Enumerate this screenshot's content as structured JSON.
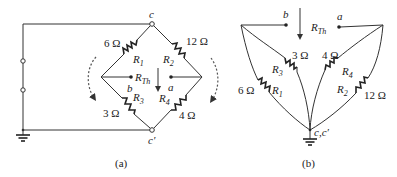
{
  "figure_a": {
    "caption": "(a)",
    "nodes": {
      "top": "c",
      "bottom": "c′",
      "left_terminal": "b",
      "right_terminal": "a"
    },
    "resistors": [
      {
        "id": "R1",
        "name": "R",
        "sub": "1",
        "value": "6 Ω"
      },
      {
        "id": "R2",
        "name": "R",
        "sub": "2",
        "value": "12 Ω"
      },
      {
        "id": "R3",
        "name": "R",
        "sub": "3",
        "value": "3 Ω"
      },
      {
        "id": "R4",
        "name": "R",
        "sub": "4",
        "value": "4 Ω"
      }
    ],
    "rth": {
      "name": "R",
      "sub": "Th"
    }
  },
  "figure_b": {
    "caption": "(b)",
    "nodes": {
      "bottom": "c,c′",
      "left_terminal": "b",
      "right_terminal": "a"
    },
    "resistors": [
      {
        "id": "R1",
        "name": "R",
        "sub": "1",
        "value": "6 Ω"
      },
      {
        "id": "R2",
        "name": "R",
        "sub": "2",
        "value": "12 Ω"
      },
      {
        "id": "R3",
        "name": "R",
        "sub": "3",
        "value": "3 Ω"
      },
      {
        "id": "R4",
        "name": "R",
        "sub": "4",
        "value": "4 Ω"
      }
    ],
    "rth": {
      "name": "R",
      "sub": "Th"
    }
  }
}
